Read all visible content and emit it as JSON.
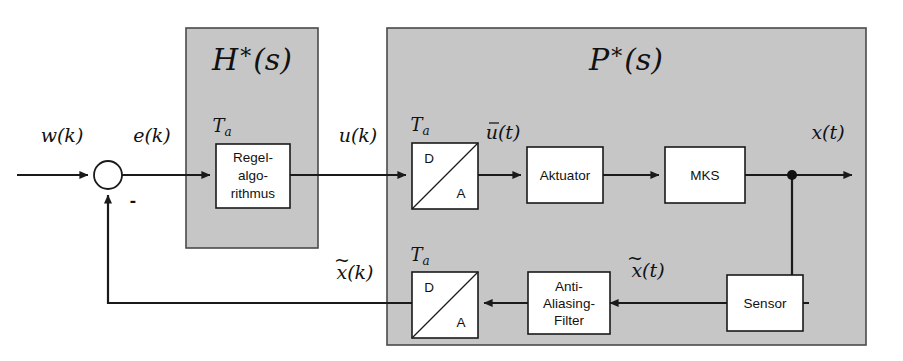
{
  "diagram": {
    "background_color": "#ffffff",
    "zone_fill_color": "#c6c6c6",
    "zone_stroke_color": "#4a4a4a",
    "block_fill_color": "#ffffff",
    "line_color": "#1a1a1a"
  },
  "zones": {
    "controller": {
      "label": "H*(s)",
      "label_plain": "H*(s)",
      "x": 186,
      "y": 28,
      "w": 132,
      "h": 220
    },
    "plant": {
      "label": "P*(s)",
      "label_plain": "P*(s)",
      "x": 387,
      "y": 28,
      "w": 479,
      "h": 317
    }
  },
  "blocks": {
    "controller_algorithm": {
      "lines": [
        "Regel-",
        "algo-",
        "rithmus"
      ],
      "sample_time_label": "Ta",
      "x": 216,
      "y": 144,
      "w": 74,
      "h": 64
    },
    "da_converter": {
      "left_label": "D",
      "right_label": "A",
      "sample_time_label": "Ta",
      "x": 412,
      "y": 143,
      "w": 66,
      "h": 66
    },
    "actuator": {
      "label": "Aktuator",
      "x": 527,
      "y": 147,
      "w": 76,
      "h": 56
    },
    "mks": {
      "label": "MKS",
      "x": 665,
      "y": 147,
      "w": 80,
      "h": 56
    },
    "sensor": {
      "label": "Sensor",
      "x": 727,
      "y": 275,
      "w": 76,
      "h": 56
    },
    "anti_aliasing_filter": {
      "lines": [
        "Anti-",
        "Aliasing-",
        "Filter"
      ],
      "x": 528,
      "y": 272,
      "w": 76,
      "h": 62
    },
    "ad_converter": {
      "left_label": "D",
      "right_label": "A",
      "sample_time_label": "Ta",
      "x": 412,
      "y": 272,
      "w": 66,
      "h": 66
    }
  },
  "summing_junction": {
    "cx": 108,
    "cy": 175,
    "r": 14,
    "negative_sign": "-"
  },
  "junction_dot": {
    "cx": 792,
    "cy": 175,
    "r": 5
  },
  "signals": {
    "reference": {
      "label": "w(k)",
      "x": 62,
      "y": 137
    },
    "error": {
      "label": "e(k)",
      "x": 152,
      "y": 137
    },
    "control_discrete": {
      "label": "u(k)",
      "x": 358,
      "y": 137
    },
    "control_held": {
      "label": "u(t)",
      "overbar": true,
      "x": 503,
      "y": 131
    },
    "output": {
      "label": "x(t)",
      "x": 828,
      "y": 134
    },
    "measured_continuous": {
      "label": "x(t)",
      "tilde": true,
      "x": 648,
      "y": 270
    },
    "measured_discrete": {
      "label": "x(k)",
      "tilde": true,
      "x": 355,
      "y": 272
    }
  },
  "wires": {
    "main_line_y": 175,
    "feedback_line_y": 303,
    "feedback_left_x": 108,
    "output_arrow_end_x": 852
  }
}
